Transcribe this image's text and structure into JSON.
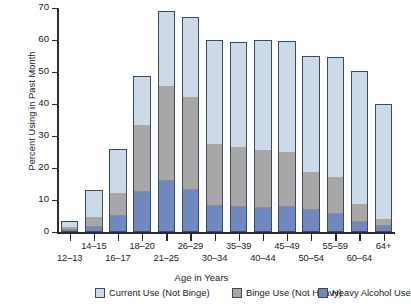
{
  "chart_data": {
    "type": "bar",
    "title": "",
    "subtitle": "",
    "stacked": true,
    "xlabel": "Age in Years",
    "ylabel": "Percent Using in Past Month",
    "ylim": [
      0,
      70
    ],
    "yticks": [
      0,
      10,
      20,
      30,
      40,
      50,
      60,
      70
    ],
    "ytick_labels": [
      "0",
      "10",
      "20",
      "30",
      "40",
      "50",
      "60",
      "70"
    ],
    "grid": false,
    "legend_position": "bottom",
    "categories": [
      "12–13",
      "14–15",
      "16–17",
      "18–20",
      "21–25",
      "26–29",
      "30–34",
      "35–39",
      "40–44",
      "45–49",
      "50–54",
      "55–59",
      "60–64",
      "64+"
    ],
    "series": [
      {
        "name": "Heavy Alcohol Use",
        "color": "#6f88bf",
        "values": [
          0.4,
          1.2,
          4.7,
          12.2,
          15.9,
          12.8,
          7.9,
          7.6,
          7.4,
          7.5,
          6.7,
          5.4,
          3.0,
          1.5
        ]
      },
      {
        "name": "Binge Use (Not Heavy)",
        "color": "#a7a7a7",
        "values": [
          1.1,
          3.3,
          7.6,
          21.3,
          29.9,
          29.4,
          19.5,
          18.9,
          18.1,
          17.4,
          12.1,
          11.6,
          5.6,
          2.4
        ]
      },
      {
        "name": "Current Use (Not Binge)",
        "color": "#ccd9e7",
        "values": [
          2.0,
          8.5,
          13.7,
          15.4,
          23.3,
          25.0,
          32.5,
          33.0,
          34.6,
          34.9,
          36.2,
          37.8,
          41.7,
          36.2
        ]
      }
    ],
    "totals": [
      3.5,
      13.0,
      26.0,
      48.9,
      69.1,
      67.2,
      59.9,
      59.5,
      60.1,
      59.8,
      55.0,
      54.8,
      50.3,
      40.1
    ]
  },
  "axis": {
    "y_title": "Percent Using in Past Month",
    "x_title": "Age in Years"
  },
  "legend": {
    "items": [
      {
        "label": "Current Use (Not Binge)",
        "color": "#ccd9e7"
      },
      {
        "label": "Binge Use (Not Heavy)",
        "color": "#a7a7a7"
      },
      {
        "label": "Heavy Alcohol Use",
        "color": "#6f88bf"
      }
    ]
  }
}
